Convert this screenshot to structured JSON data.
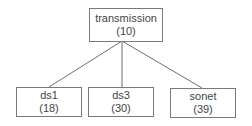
{
  "diagram": {
    "type": "tree",
    "root": {
      "label": "transmission",
      "count": "(10)"
    },
    "children": [
      {
        "label": "ds1",
        "count": "(18)"
      },
      {
        "label": "ds3",
        "count": "(30)"
      },
      {
        "label": "sonet",
        "count": "(39)"
      }
    ],
    "colors": {
      "border": "#7a7a7a",
      "edge": "#6e6e6e",
      "text": "#444444"
    }
  }
}
